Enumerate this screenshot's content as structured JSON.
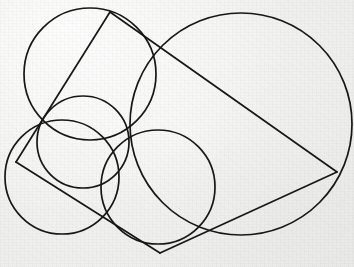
{
  "figure": {
    "domain_kind": "geometry-diagram",
    "canvas": {
      "width": 354,
      "height": 267
    },
    "background_color": "#f2f2f0",
    "stroke_color": "#171717",
    "stroke_width": 1.7
  },
  "chart_data": {
    "type": "scatter",
    "xlabel": "",
    "ylabel": "",
    "xlim": [
      0,
      354
    ],
    "ylim": [
      0,
      267
    ],
    "grid": false,
    "legend": "none",
    "circles": [
      {
        "name": "large-right-circle",
        "cx": 241,
        "cy": 124,
        "r": 111,
        "label": "Large circle (right)"
      },
      {
        "name": "upper-left-circle",
        "cx": 90,
        "cy": 74,
        "r": 66,
        "label": "Upper-left circle"
      },
      {
        "name": "lower-left-circle",
        "cx": 62,
        "cy": 177,
        "r": 57,
        "label": "Lower-left circle"
      },
      {
        "name": "lower-middle-circle",
        "cx": 158,
        "cy": 187,
        "r": 57,
        "label": "Lower-middle circle"
      },
      {
        "name": "middle-lens-circle",
        "cx": 83,
        "cy": 142,
        "r": 46,
        "label": "Middle small circle"
      }
    ],
    "polygon_vertices": [
      {
        "name": "apex-top",
        "x": 110,
        "y": 12
      },
      {
        "name": "right-vertex",
        "x": 337,
        "y": 172
      },
      {
        "name": "bottom-vertex",
        "x": 160,
        "y": 253
      },
      {
        "name": "left-vertex",
        "x": 16,
        "y": 162
      }
    ],
    "chords": [
      {
        "name": "chord-top-to-right",
        "x1": 110,
        "y1": 12,
        "x2": 337,
        "y2": 172
      },
      {
        "name": "chord-right-to-bottom",
        "x1": 337,
        "y1": 172,
        "x2": 160,
        "y2": 253
      },
      {
        "name": "chord-bottom-to-left",
        "x1": 160,
        "y1": 253,
        "x2": 16,
        "y2": 162
      },
      {
        "name": "chord-left-to-top",
        "x1": 16,
        "y1": 162,
        "x2": 110,
        "y2": 12
      }
    ],
    "intersection_nodes": [
      {
        "name": "node-central",
        "x": 127,
        "y": 140
      },
      {
        "name": "node-upper-right",
        "x": 158,
        "y": 47
      },
      {
        "name": "node-lower-left",
        "x": 112,
        "y": 219
      },
      {
        "name": "node-lower-right",
        "x": 212,
        "y": 232
      }
    ]
  }
}
